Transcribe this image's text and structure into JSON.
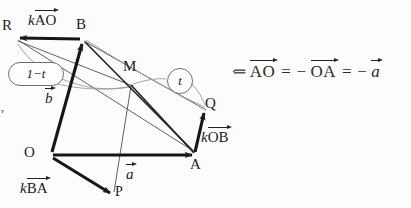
{
  "figure": {
    "points": [
      {
        "id": "R",
        "label": "R",
        "x": 14,
        "y": 38
      },
      {
        "id": "B",
        "label": "B",
        "x": 82,
        "y": 38
      },
      {
        "id": "M",
        "label": "M",
        "x": 131,
        "y": 84
      },
      {
        "id": "Q",
        "label": "Q",
        "x": 205,
        "y": 108
      },
      {
        "id": "O",
        "label": "O",
        "x": 51,
        "y": 155
      },
      {
        "id": "A",
        "label": "A",
        "x": 196,
        "y": 155
      },
      {
        "id": "P",
        "label": "P",
        "x": 112,
        "y": 196
      }
    ],
    "vector_labels": [
      {
        "id": "kAO",
        "scalar": "k",
        "name": "AO",
        "x": 28,
        "y": 12
      },
      {
        "id": "b",
        "scalar": "",
        "name": "b",
        "x": 47,
        "y": 92
      },
      {
        "id": "a",
        "scalar": "",
        "name": "a",
        "x": 127,
        "y": 168
      },
      {
        "id": "kBA",
        "scalar": "k",
        "name": "BA",
        "x": 22,
        "y": 180
      },
      {
        "id": "kOB",
        "scalar": "k",
        "name": "OB",
        "x": 203,
        "y": 130
      }
    ],
    "bubbles": [
      {
        "id": "one-minus-t",
        "text": "1−t",
        "x": 8,
        "y": 62,
        "w": 54,
        "h": 22,
        "shape": "rounded"
      },
      {
        "id": "t",
        "text": "t",
        "x": 167,
        "y": 68,
        "w": 24,
        "h": 24,
        "shape": "circle"
      }
    ],
    "edge_mark": {
      "text": ",",
      "x": 1,
      "y": 99
    }
  },
  "equation": {
    "arrow": "⇐",
    "terms": [
      "AO",
      "OA"
    ],
    "eq1": "=",
    "minus1": "−",
    "eq2": "=",
    "minus2": "−",
    "scalar": "a",
    "x": 232,
    "y": 60
  },
  "colors": {
    "ink": "#222222",
    "thin": "#4a4a4a",
    "light": "#8a8a8a",
    "paper": "#fdfdfd"
  }
}
